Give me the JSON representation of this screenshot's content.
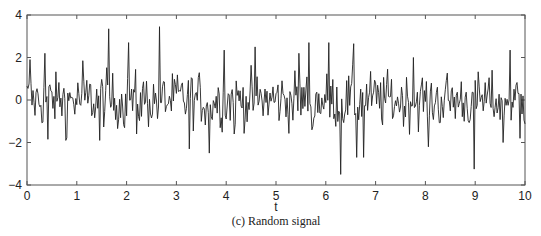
{
  "chart_data": {
    "type": "line",
    "title": "",
    "caption": "(c) Random signal",
    "xlabel": "t",
    "ylabel": "",
    "xlim": [
      0,
      10
    ],
    "ylim": [
      -4,
      4
    ],
    "xticks": [
      0,
      1,
      2,
      3,
      4,
      5,
      6,
      7,
      8,
      9,
      10
    ],
    "yticks": [
      -4,
      -2,
      0,
      2,
      4
    ],
    "grid": false,
    "legend": null,
    "line_color": "#222222",
    "sample_step": 0.02,
    "series": [
      {
        "name": "random signal",
        "notable_points": [
          {
            "t": 0.05,
            "y": 1.9
          },
          {
            "t": 0.35,
            "y": 2.2
          },
          {
            "t": 0.42,
            "y": -1.85
          },
          {
            "t": 0.78,
            "y": -1.9
          },
          {
            "t": 1.12,
            "y": 1.85
          },
          {
            "t": 1.45,
            "y": -1.9
          },
          {
            "t": 1.63,
            "y": 3.35
          },
          {
            "t": 2.05,
            "y": 2.7
          },
          {
            "t": 2.2,
            "y": -1.6
          },
          {
            "t": 2.65,
            "y": 3.45
          },
          {
            "t": 3.25,
            "y": -2.3
          },
          {
            "t": 3.65,
            "y": -2.5
          },
          {
            "t": 3.95,
            "y": 2.35
          },
          {
            "t": 4.15,
            "y": -1.6
          },
          {
            "t": 4.57,
            "y": 2.5
          },
          {
            "t": 5.45,
            "y": 2.2
          },
          {
            "t": 5.65,
            "y": 2.7
          },
          {
            "t": 5.72,
            "y": -1.4
          },
          {
            "t": 6.3,
            "y": -3.5
          },
          {
            "t": 6.05,
            "y": 2.7
          },
          {
            "t": 6.55,
            "y": 2.65
          },
          {
            "t": 6.62,
            "y": -2.7
          },
          {
            "t": 6.75,
            "y": -2.7
          },
          {
            "t": 7.75,
            "y": 2.0
          },
          {
            "t": 8.05,
            "y": -2.2
          },
          {
            "t": 8.98,
            "y": -3.25
          },
          {
            "t": 9.55,
            "y": -2.0
          },
          {
            "t": 9.7,
            "y": 2.35
          },
          {
            "t": 9.9,
            "y": -1.8
          }
        ]
      }
    ]
  }
}
